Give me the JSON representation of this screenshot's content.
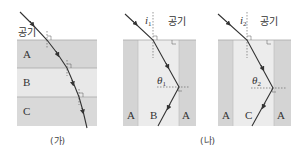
{
  "figure_a": {
    "caption": "(가)",
    "air_label": "공기",
    "layers": [
      {
        "label": "A",
        "color": "#d6d6d6"
      },
      {
        "label": "B",
        "color": "#e6e6e6"
      },
      {
        "label": "C",
        "color": "#d9d9d9"
      }
    ]
  },
  "figure_b": {
    "caption": "(나)",
    "panels": [
      {
        "air_label": "공기",
        "incident_angle": "i",
        "incident_sub": "1",
        "refract_angle": "θ",
        "refract_sub": "1",
        "left_label": "A",
        "core_label": "B",
        "right_label": "A"
      },
      {
        "air_label": "공기",
        "incident_angle": "i",
        "incident_sub": "2",
        "refract_angle": "θ",
        "refract_sub": "2",
        "left_label": "A",
        "core_label": "C",
        "right_label": "A"
      }
    ]
  },
  "colors": {
    "cladding": "#d4d4d4",
    "core": "#ececec",
    "ray": "#333333"
  }
}
